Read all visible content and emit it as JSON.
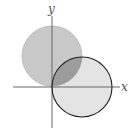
{
  "diagram": {
    "type": "venn-coordinate-plane",
    "axes": {
      "x_label": "x",
      "y_label": "y",
      "origin": [
        52,
        87
      ],
      "color": "#666666"
    },
    "circles": [
      {
        "name": "upper-left-circle",
        "center": [
          52,
          56
        ],
        "radius": 30,
        "fill": "#c8c8c8",
        "stroke": "#b0b0b0"
      },
      {
        "name": "lower-right-circle",
        "center": [
          82,
          87
        ],
        "radius": 30,
        "fill": "#e4e4e4",
        "stroke": "#222222"
      }
    ],
    "intersection_fill": "#9a9a9a"
  }
}
